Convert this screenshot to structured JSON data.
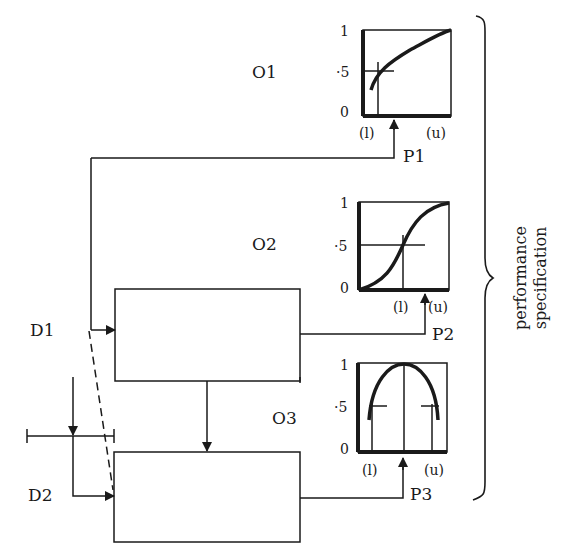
{
  "diagram": {
    "outputs": [
      {
        "label": "O1",
        "y_ticks": [
          "1",
          "·5",
          "0"
        ],
        "x_labels": [
          "(l)",
          "(u)"
        ],
        "param": "P1",
        "curve": "concave-rising"
      },
      {
        "label": "O2",
        "y_ticks": [
          "1",
          "·5",
          "0"
        ],
        "x_labels": [
          "(l)",
          "(u)"
        ],
        "param": "P2",
        "curve": "sigmoid"
      },
      {
        "label": "O3",
        "y_ticks": [
          "1",
          "·5",
          "0"
        ],
        "x_labels": [
          "(l)",
          "(u)"
        ],
        "param": "P3",
        "curve": "inverted-parabola"
      }
    ],
    "inputs": [
      "D1",
      "D2"
    ],
    "brace_label_line1": "performance",
    "brace_label_line2": "specification",
    "colors": {
      "ink": "#1a1a1a",
      "background": "#ffffff"
    }
  }
}
